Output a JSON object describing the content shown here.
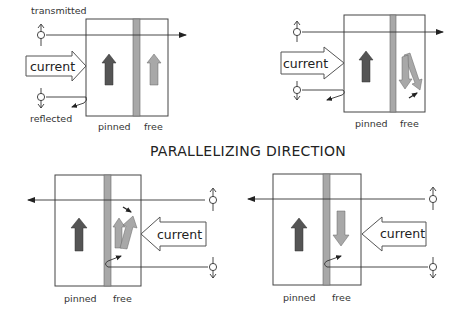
{
  "title": "PARALLELIZING DIRECTION",
  "colors": {
    "pinned_arrow": "#555555",
    "free_arrow": "#a8a8a8",
    "spacer": "#a8a8a8",
    "outline": "#444444"
  },
  "panels": [
    {
      "id": "top-left",
      "labels": {
        "transmitted": "transmitted",
        "reflected": "reflected",
        "current": "current",
        "pinned": "pinned",
        "free": "free"
      },
      "free_state": "parallel-up"
    },
    {
      "id": "top-right",
      "labels": {
        "current": "current",
        "pinned": "pinned",
        "free": "free"
      },
      "free_state": "rotating-down"
    },
    {
      "id": "bottom-left",
      "labels": {
        "current": "current",
        "pinned": "pinned",
        "free": "free"
      },
      "free_state": "rotating-up"
    },
    {
      "id": "bottom-right",
      "labels": {
        "current": "current",
        "pinned": "pinned",
        "free": "free"
      },
      "free_state": "antiparallel-down"
    }
  ]
}
